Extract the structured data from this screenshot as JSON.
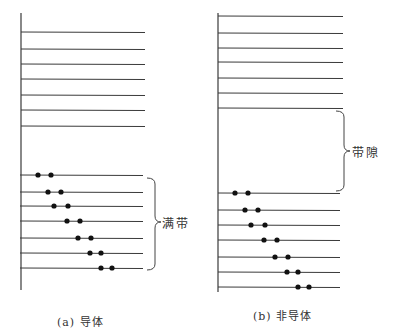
{
  "panels": [
    {
      "id": "a",
      "caption": "(a) 导体",
      "band_label": "满带",
      "axis": {
        "x": 21,
        "y1": 13,
        "y2": 290
      },
      "upper_levels": {
        "x1": 21,
        "x2": 145,
        "ys": [
          32,
          49,
          64,
          79,
          95,
          110,
          126
        ]
      },
      "lower_levels": {
        "x1": 20,
        "x2": 143,
        "ys": [
          175,
          192,
          206,
          221,
          238,
          253,
          268
        ]
      },
      "electrons": [
        [
          38,
          51
        ],
        [
          48,
          61
        ],
        [
          54,
          68
        ],
        [
          67,
          80
        ],
        [
          78,
          91
        ],
        [
          90,
          101
        ],
        [
          101,
          112
        ]
      ],
      "brace": {
        "x": 147,
        "y1": 178,
        "y2": 270,
        "tip": 222
      },
      "band_label_pos": {
        "x": 162,
        "y": 214
      },
      "caption_pos": {
        "x": 57,
        "y": 313
      }
    },
    {
      "id": "b",
      "caption": "(b) 非导体",
      "band_label": "带隙",
      "axis": {
        "x": 218,
        "y1": 13,
        "y2": 292
      },
      "upper_levels": {
        "x1": 218,
        "x2": 343,
        "ys": [
          16,
          33,
          48,
          62,
          78,
          93,
          108
        ]
      },
      "lower_levels": {
        "x1": 218,
        "x2": 340,
        "ys": [
          193,
          210,
          225,
          240,
          257,
          272,
          287
        ]
      },
      "electrons": [
        [
          235,
          248
        ],
        [
          245,
          258
        ],
        [
          251,
          265
        ],
        [
          264,
          277
        ],
        [
          275,
          288
        ],
        [
          287,
          298
        ],
        [
          298,
          309
        ]
      ],
      "brace": {
        "x": 336,
        "y1": 111,
        "y2": 191,
        "tip": 151
      },
      "band_label_pos": {
        "x": 352,
        "y": 143
      },
      "caption_pos": {
        "x": 253,
        "y": 307
      }
    }
  ],
  "colors": {
    "line": "#3a3a3a",
    "electron": "#111111",
    "text": "#333333"
  }
}
